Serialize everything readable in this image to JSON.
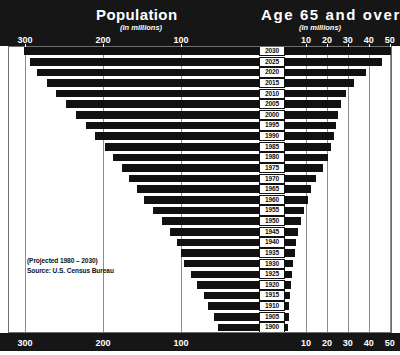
{
  "header": {
    "left_title": "Population",
    "left_subtitle": "(in millions)",
    "right_title": "Age 65 and over",
    "right_subtitle": "(in millions)"
  },
  "annotation": {
    "line1": "(Projected 1980 – 2030)",
    "line2": "Source: U.S. Census Bureau"
  },
  "axes": {
    "left_ticks": [
      "300",
      "200",
      "100"
    ],
    "right_ticks": [
      "10",
      "20",
      "30",
      "40",
      "50"
    ]
  },
  "chart_data": {
    "type": "bar",
    "subtitle": "(in millions)",
    "orientation": "horizontal-bidirectional",
    "categories": [
      "2030",
      "2025",
      "2020",
      "2015",
      "2010",
      "2005",
      "2000",
      "1995",
      "1990",
      "1985",
      "1980",
      "1975",
      "1970",
      "1965",
      "1960",
      "1955",
      "1950",
      "1945",
      "1940",
      "1935",
      "1930",
      "1925",
      "1920",
      "1915",
      "1910",
      "1905",
      "1900"
    ],
    "xlabel": "",
    "ylabel": "Year",
    "grid": true,
    "legend_position": "none",
    "series": [
      {
        "name": "Population",
        "units": "millions",
        "axis": "left",
        "direction": "left",
        "xlim": [
          0,
          310
        ],
        "ticks": [
          300,
          200,
          100
        ],
        "values": [
          301,
          294,
          284,
          272,
          260,
          247,
          235,
          222,
          210,
          198,
          187,
          176,
          167,
          157,
          147,
          136,
          125,
          114,
          105,
          100,
          96,
          87,
          80,
          71,
          65,
          58,
          52
        ]
      },
      {
        "name": "Age 65 and over",
        "units": "millions",
        "axis": "right",
        "direction": "right",
        "xlim": [
          0,
          52
        ],
        "ticks": [
          10,
          20,
          30,
          40,
          50
        ],
        "values": [
          50.5,
          46.5,
          38.5,
          33.0,
          29.0,
          26.5,
          25.5,
          24.5,
          23.5,
          22.0,
          20.5,
          18.0,
          15.0,
          12.5,
          11.0,
          9.0,
          7.5,
          6.2,
          5.3,
          4.6,
          4.0,
          3.4,
          2.9,
          2.5,
          2.1,
          1.8,
          1.6
        ]
      }
    ]
  }
}
